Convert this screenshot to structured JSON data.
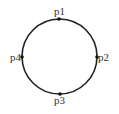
{
  "diagram": {
    "shape": "circle",
    "circle": {
      "cx": 59.5,
      "cy": 56.5,
      "r": 37.5,
      "stroke": "#222222",
      "stroke_width": 1.6
    },
    "points": [
      {
        "id": "p1",
        "label": "p1",
        "x": 59,
        "y": 19,
        "label_x": 59.5,
        "label_y": 15,
        "anchor": "middle"
      },
      {
        "id": "p2",
        "label": "p2",
        "x": 97,
        "y": 57,
        "label_x": 98,
        "label_y": 61,
        "anchor": "start"
      },
      {
        "id": "p3",
        "label": "p3",
        "x": 60,
        "y": 94,
        "label_x": 59.5,
        "label_y": 104,
        "anchor": "middle"
      },
      {
        "id": "p4",
        "label": "p4",
        "x": 22,
        "y": 57,
        "label_x": 21,
        "label_y": 61,
        "anchor": "end"
      }
    ],
    "point_color": "#111111"
  }
}
